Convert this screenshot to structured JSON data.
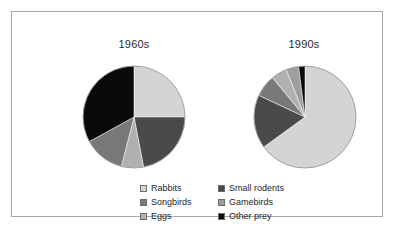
{
  "figure": {
    "background": "#ffffff",
    "frame_color": "#a8a8a8"
  },
  "chart_data": {
    "type": "pie",
    "title": "",
    "legend_position": "bottom",
    "categories": [
      "Rabbits",
      "Small rodents",
      "Songbirds",
      "Gamebirds",
      "Eggs",
      "Other prey"
    ],
    "colors": {
      "Rabbits": "#d4d4d4",
      "Small rodents": "#4a4a4a",
      "Songbirds": "#787878",
      "Gamebirds": "#9e9e9e",
      "Eggs": "#b0b0b0",
      "Other prey": "#0a0a0a"
    },
    "charts": [
      {
        "title": "1960s",
        "slice_order": [
          "Rabbits",
          "Small rodents",
          "Eggs",
          "Songbirds",
          "Other prey"
        ],
        "values": [
          25,
          22,
          7,
          13,
          33
        ],
        "labels": [
          "Rabbits",
          "Small rodents",
          "Eggs",
          "Songbirds",
          "Other prey"
        ]
      },
      {
        "title": "1990s",
        "slice_order": [
          "Rabbits",
          "Small rodents",
          "Songbirds",
          "Eggs",
          "Gamebirds",
          "Other prey"
        ],
        "values": [
          65,
          17,
          7,
          5,
          4,
          2
        ],
        "labels": [
          "Rabbits",
          "Small rodents",
          "Songbirds",
          "Eggs",
          "Gamebirds",
          "Other prey"
        ]
      }
    ]
  },
  "titles": {
    "left": "1960s",
    "right": "1990s"
  },
  "legend": {
    "rows": [
      {
        "left": {
          "label": "Rabbits",
          "color": "#d4d4d4"
        },
        "right": {
          "label": "Small rodents",
          "color": "#4a4a4a"
        }
      },
      {
        "left": {
          "label": "Songbirds",
          "color": "#787878"
        },
        "right": {
          "label": "Gamebirds",
          "color": "#9e9e9e"
        }
      },
      {
        "left": {
          "label": "Eggs",
          "color": "#b0b0b0"
        },
        "right": {
          "label": "Other prey",
          "color": "#0a0a0a"
        }
      }
    ]
  }
}
